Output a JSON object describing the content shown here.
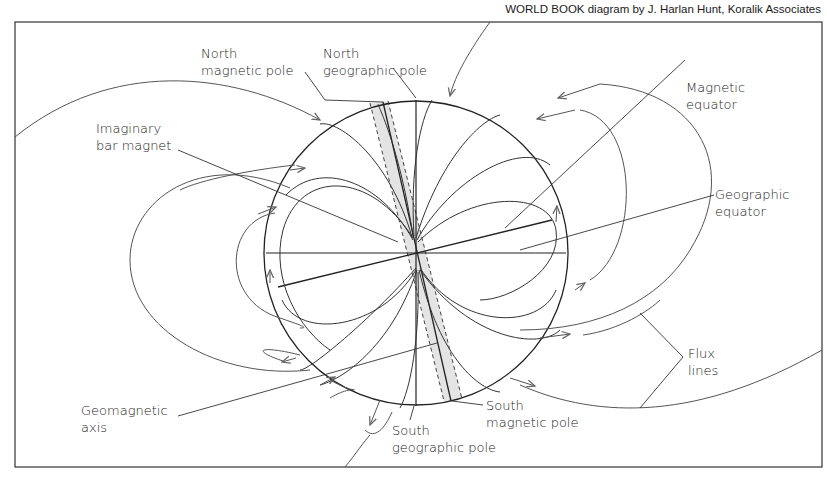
{
  "credit": "WORLD BOOK diagram by J. Harlan Hunt, Koralik Associates",
  "labels": {
    "north_magnetic_pole": [
      "North",
      "magnetic pole"
    ],
    "north_geographic_pole": [
      "North",
      "geographic pole"
    ],
    "imaginary_bar_magnet": [
      "Imaginary",
      "bar magnet"
    ],
    "magnetic_equator": [
      "Magnetic",
      "equator"
    ],
    "geographic_equator": [
      "Geographic",
      "equator"
    ],
    "flux_lines": [
      "Flux",
      "lines"
    ],
    "geomagnetic_axis": [
      "Geomagnetic",
      "axis"
    ],
    "south_geographic_pole": [
      "South",
      "geographic pole"
    ],
    "south_magnetic_pole": [
      "South",
      "magnetic pole"
    ]
  },
  "colors": {
    "line": "#2a2a2a",
    "flux_line": "#555555",
    "magnet_fill": "#e4e4e4",
    "frame": "#333333"
  }
}
